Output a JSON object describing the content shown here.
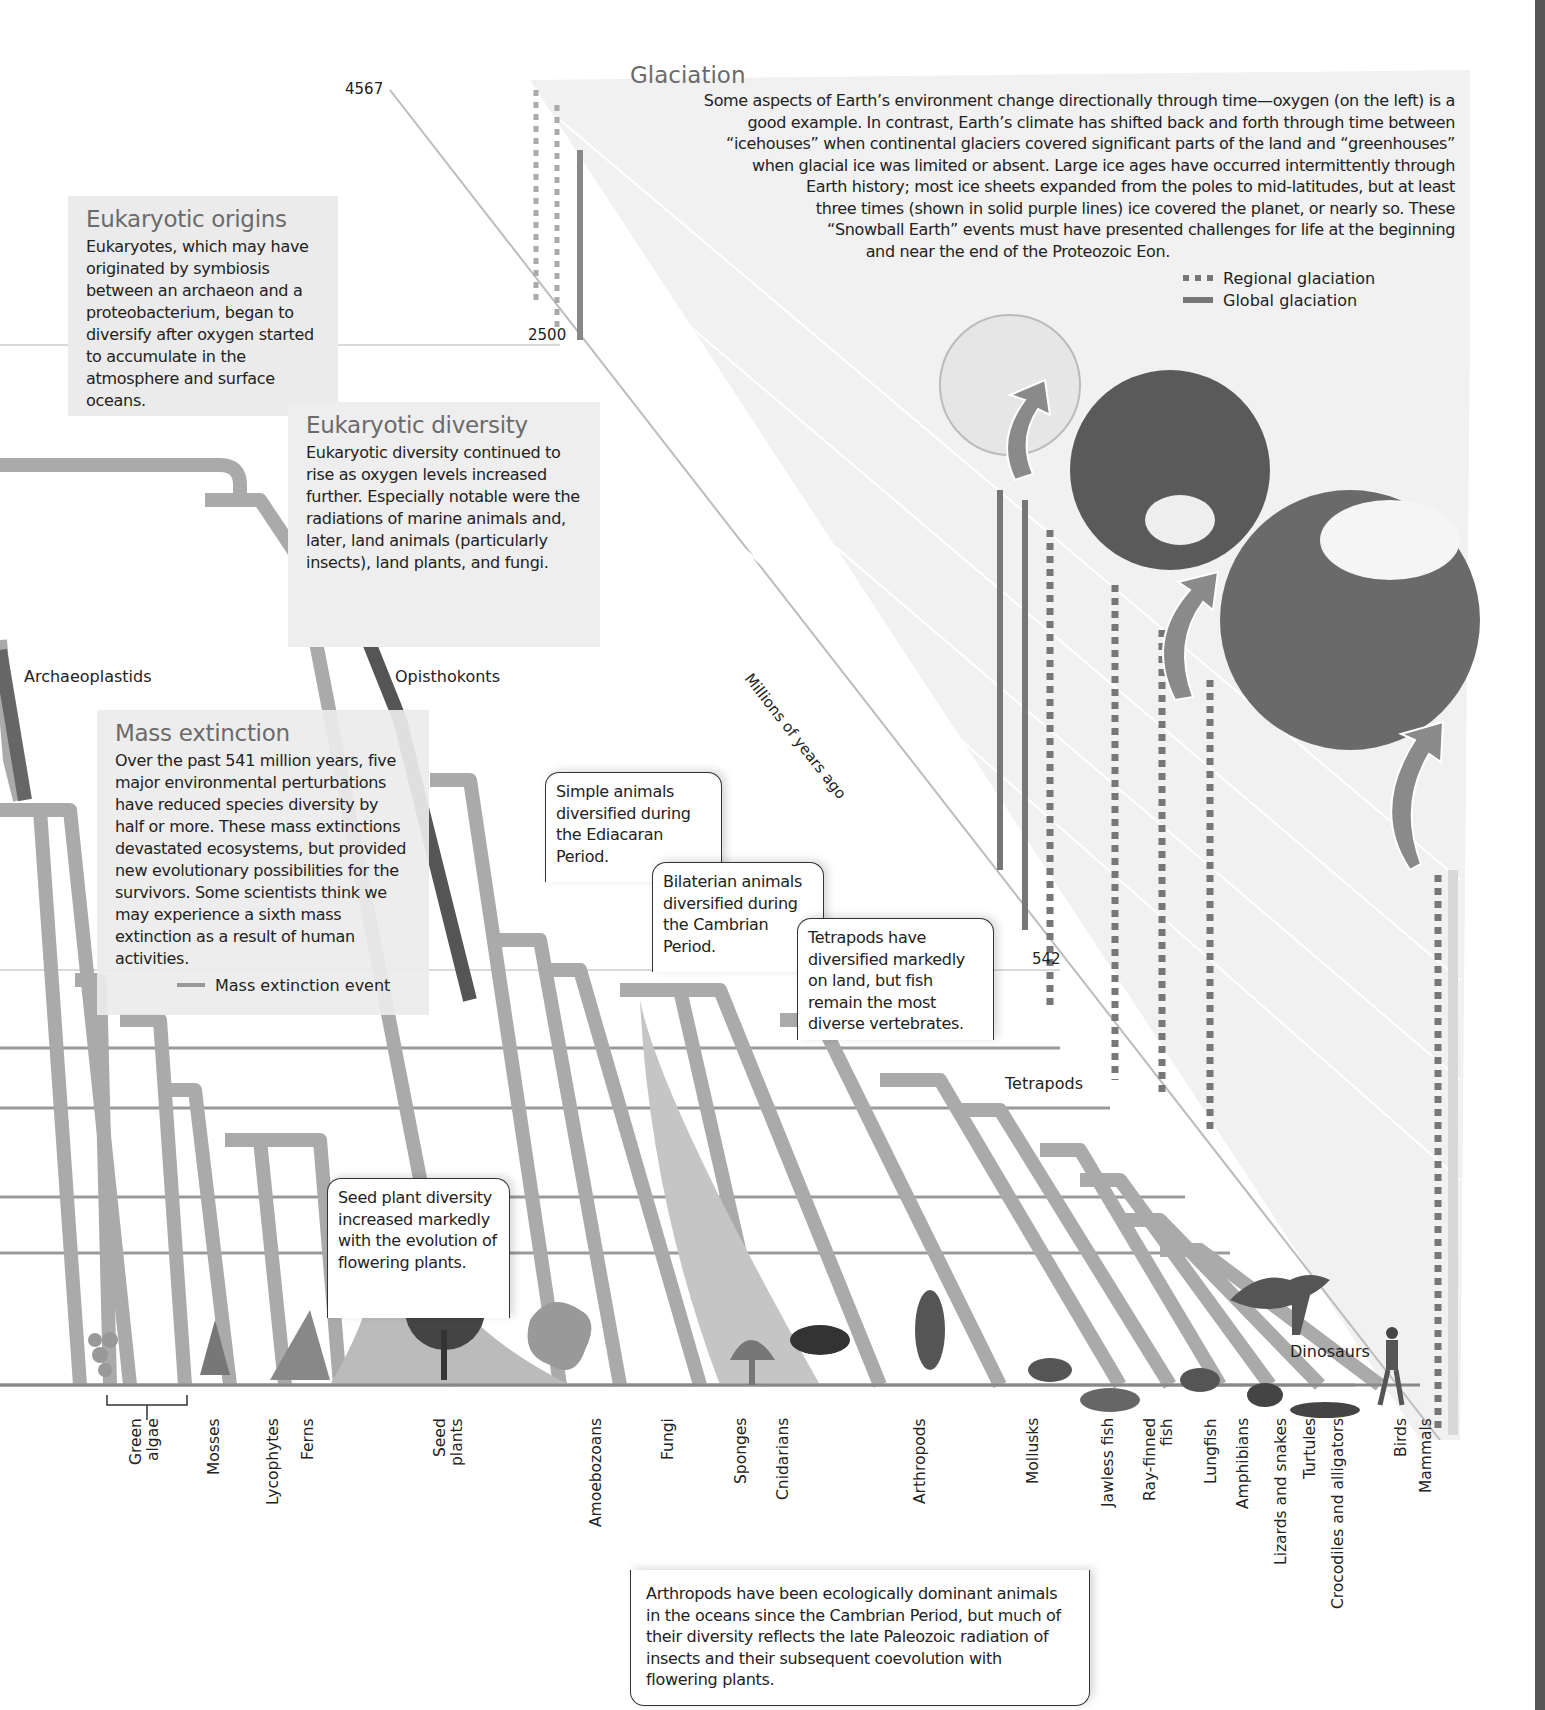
{
  "axis": {
    "label": "Millions of years ago",
    "ticks": [
      "4567",
      "2500",
      "542"
    ]
  },
  "glaciation": {
    "title": "Glaciation",
    "lines": [
      "Some aspects of Earth’s environment change directionally through time—oxygen (on the left) is a",
      "good example. In contrast, Earth’s climate has shifted back and forth through time between",
      "“icehouses” when continental glaciers covered significant parts of the land and “greenhouses”",
      "when glacial ice was limited or absent. Large ice ages have occurred intermittently through",
      "Earth history; most ice sheets expanded from the poles to mid-latitudes, but at least",
      "three times (shown in solid purple lines) ice covered the planet, or nearly so. These",
      "“Snowball Earth” events must have presented challenges for life at the beginning",
      "and near the end of the Proteozoic Eon."
    ],
    "legend": [
      {
        "icon": "dashed-line-icon",
        "label": "Regional glaciation"
      },
      {
        "icon": "solid-line-icon",
        "label": "Global glaciation"
      }
    ]
  },
  "eukaryotic_origins": {
    "title": "Eukaryotic origins",
    "text": "Eukaryotes, which may have originated by symbiosis between an archaeon and a proteobacterium, began to diversify after oxygen started to accumulate in the atmosphere and surface oceans."
  },
  "eukaryotic_diversity": {
    "title": "Eukaryotic diversity",
    "text": "Eukaryotic diversity continued to rise as oxygen levels increased further. Especially notable were the radiations of marine animals and, later, land animals (particularly insects), land plants, and fungi."
  },
  "mass_extinction": {
    "title": "Mass extinction",
    "text": "Over the past 541 million years, five major environmental perturbations have reduced species diversity by half or more. These mass extinctions devastated ecosystems, but provided new evolutionary possibilities for the survivors. Some scientists think we may experience a sixth mass extinction as a result of human activities.",
    "legend_label": "Mass extinction event"
  },
  "clade_labels": {
    "archaeoplastids": "Archaeoplastids",
    "opisthokonts": "Opisthokonts",
    "tetrapods": "Tetrapods",
    "dinosaurs": "Dinosaurs"
  },
  "callouts": {
    "simple_animals": "Simple animals diversified during the Ediacaran Period.",
    "bilaterian": "Bilaterian animals diversified during the Cambrian Period.",
    "tetrapods": "Tetrapods have diversified markedly on land, but fish remain the most diverse vertebrates.",
    "seed_plants": "Seed plant diversity increased markedly with the evolution of flowering plants.",
    "arthropods": "Arthropods have been ecologically dominant animals in the oceans since the Cambrian Period, but much of their diversity reflects the late Paleozoic radiation of insects and their subsequent coevolution with flowering plants."
  },
  "taxa": [
    {
      "label": "Green\nalgae",
      "x": 130
    },
    {
      "label": "Mosses",
      "x": 208
    },
    {
      "label": "Lycophytes",
      "x": 265
    },
    {
      "label": "Ferns",
      "x": 300
    },
    {
      "label": "Seed\nplants",
      "x": 425
    },
    {
      "label": "Amoebozoans",
      "x": 588
    },
    {
      "label": "Fungi",
      "x": 660
    },
    {
      "label": "Sponges",
      "x": 733
    },
    {
      "label": "Cnidarians",
      "x": 775
    },
    {
      "label": "Arthropods",
      "x": 912
    },
    {
      "label": "Mollusks",
      "x": 1025
    },
    {
      "label": "Jawless fish",
      "x": 1100
    },
    {
      "label": "Ray-finned\nfish",
      "x": 1140
    },
    {
      "label": "Lungfish",
      "x": 1203
    },
    {
      "label": "Amphibians",
      "x": 1235
    },
    {
      "label": "Lizards and snakes",
      "x": 1275
    },
    {
      "label": "Turtules",
      "x": 1302
    },
    {
      "label": "Crocodiles and alligators",
      "x": 1330
    },
    {
      "label": "Birds",
      "x": 1393
    },
    {
      "label": "Mammals",
      "x": 1418
    }
  ]
}
